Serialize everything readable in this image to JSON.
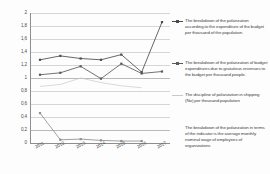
{
  "chart_data": {
    "type": "line",
    "title": "",
    "xlabel": "",
    "ylabel": "",
    "categories": [
      "2011",
      "2012",
      "2013",
      "2014",
      "2015",
      "2016",
      "2017"
    ],
    "ylim": [
      0,
      2
    ],
    "ytick_labels": [
      "2",
      "1,8",
      "1,6",
      "1,4",
      "1,2",
      "1",
      "0,8",
      "0,6",
      "0,4",
      "0,2",
      "0"
    ],
    "ytick_values": [
      2,
      1.8,
      1.6,
      1.4,
      1.2,
      1.0,
      0.8,
      0.6,
      0.4,
      0.2,
      0
    ],
    "grid": true,
    "legend_position": "right",
    "series": [
      {
        "name": "The breakdown of the polarization according to the expenditure of the budget per thousand of the population.",
        "color": "#4c4c4c",
        "marker": "square",
        "values": [
          1.28,
          1.34,
          1.3,
          1.28,
          1.36,
          1.09,
          1.86
        ]
      },
      {
        "name": "The breakdown of the polarization of budget expenditures due to gratuitous revenues to the budget per thousand people.",
        "color": "#5a5a5a",
        "marker": "square",
        "values": [
          1.05,
          1.08,
          1.18,
          0.99,
          1.22,
          1.07,
          1.1
        ]
      },
      {
        "name": "The discipline of polarization in shipping (No) per thousand population",
        "color": "#c9c9c9",
        "marker": "none",
        "values": [
          0.87,
          0.9,
          1.0,
          0.93,
          0.88,
          0.85,
          null
        ]
      },
      {
        "name": "The breakdown of the polarization in terms of the indicator is the average monthly nominal wage of employees of organizations",
        "color": "#8f8f8f",
        "marker": "square",
        "values": [
          0.46,
          0.05,
          0.06,
          0.04,
          0.03,
          0.03,
          null
        ]
      }
    ]
  },
  "legend": {
    "entries": [
      {
        "label": "The breakdown of the polarization according to the expenditure of the budget per thousand of the population.",
        "color": "#4c4c4c",
        "has_marker": true
      },
      {
        "label": "The breakdown of the polarization of budget expenditures due to gratuitous revenues to the budget per thousand people.",
        "color": "#5a5a5a",
        "has_marker": true
      },
      {
        "label": "The discipline of polarization in shipping (No) per thousand population",
        "color": "#c9c9c9",
        "has_marker": true
      },
      {
        "label": "The breakdown of the polarization in terms of the indicator is the average monthly nominal wage of employees of organizations",
        "color": "#8f8f8f",
        "has_marker": false
      }
    ]
  }
}
